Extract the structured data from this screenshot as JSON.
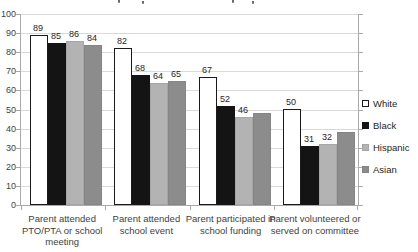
{
  "chart_data": {
    "type": "bar",
    "categories": [
      "Parent attended PTO/PTA or school meeting",
      "Parent attended school event",
      "Parent participated in school funding",
      "Parent volunteered or served on committee"
    ],
    "series": [
      {
        "name": "White",
        "color": "#ffffff",
        "border_color": "#1a1a1a",
        "values": [
          89,
          82,
          67,
          50
        ],
        "labels": [
          "89",
          "82",
          "67",
          "50"
        ]
      },
      {
        "name": "Black",
        "color": "#141414",
        "border_color": "#141414",
        "values": [
          85,
          68,
          52,
          31
        ],
        "labels": [
          "85",
          "68",
          "52",
          "31"
        ]
      },
      {
        "name": "Hispanic",
        "color": "#b3b3b3",
        "border_color": "#a6a6a6",
        "values": [
          86,
          64,
          46,
          32
        ],
        "labels": [
          "86",
          "64",
          "46",
          "32"
        ]
      },
      {
        "name": "Asian",
        "color": "#8c8c8c",
        "border_color": "#858585",
        "values": [
          84,
          65,
          48,
          38
        ],
        "labels": [
          "84",
          "65",
          "",
          ""
        ]
      }
    ],
    "ylim": [
      0,
      100
    ],
    "yticks": [
      0,
      10,
      20,
      30,
      40,
      50,
      60,
      70,
      80,
      90,
      100
    ],
    "grid": true,
    "legend_position": "right",
    "colors": {
      "gridline": "#d9d9d9",
      "axis": "#a9a9a9",
      "text": "#3f3f3f",
      "background": "#ffffff"
    }
  }
}
